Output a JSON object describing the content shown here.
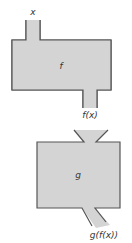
{
  "diagram": {
    "input_label": "x",
    "machine_f_label": "f",
    "intermediate_label": "f(x)",
    "machine_g_label": "g",
    "output_label": "g(f(x))"
  },
  "colors": {
    "fill": "#d4d4d4",
    "stroke": "#555555",
    "text": "#333333"
  }
}
